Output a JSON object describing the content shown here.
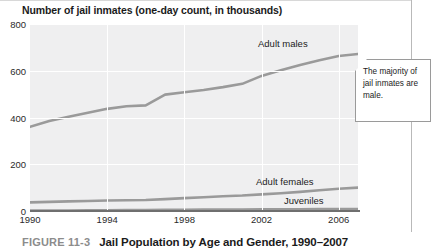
{
  "chart_title": "Number of jail inmates (one-day count, in thousands)",
  "caption": {
    "number": "FIGURE 11-3",
    "title": "Jail Population by Age and Gender, 1990–2007"
  },
  "callout": {
    "text": "The majority of jail inmates are male."
  },
  "colors": {
    "plot_background": "#efeff0",
    "gridline": "#ffffff",
    "series_line": "#9a9a9a",
    "axis": "#6f6f6f",
    "text": "#1b1b1b",
    "caption_number": "#8c8c8c"
  },
  "chart_data": {
    "type": "line",
    "title": "Number of jail inmates (one-day count, in thousands)",
    "xlabel": "",
    "ylabel": "Number of jail inmates (one-day count, in thousands)",
    "xlim": [
      1990,
      2007
    ],
    "ylim": [
      0,
      800
    ],
    "yticks": [
      0,
      200,
      400,
      600,
      800
    ],
    "ytick_labels": [
      "0",
      "200",
      "400",
      "600",
      "800"
    ],
    "xticks": [
      1990,
      1994,
      1998,
      2002,
      2006
    ],
    "xtick_labels": [
      "1990",
      "1994",
      "1998",
      "2002",
      "2006"
    ],
    "grid": true,
    "legend": "inline-labels",
    "x": [
      1990,
      1991,
      1992,
      1993,
      1994,
      1995,
      1996,
      1997,
      1998,
      1999,
      2000,
      2001,
      2002,
      2003,
      2004,
      2005,
      2006,
      2007
    ],
    "series": [
      {
        "name": "Adult males",
        "values": [
          360,
          385,
          403,
          420,
          437,
          448,
          452,
          498,
          508,
          518,
          530,
          544,
          578,
          602,
          625,
          645,
          663,
          672
        ]
      },
      {
        "name": "Adult females",
        "values": [
          37,
          39,
          41,
          43,
          45,
          46,
          47,
          51,
          55,
          59,
          63,
          66,
          71,
          76,
          82,
          89,
          95,
          100
        ]
      },
      {
        "name": "Juveniles",
        "values": [
          2,
          2,
          2,
          3,
          3,
          4,
          4,
          5,
          5,
          6,
          6,
          6,
          7,
          7,
          7,
          8,
          8,
          8
        ]
      }
    ],
    "annotations": [
      {
        "text": "The majority of jail inmates are male.",
        "anchor": "Adult males"
      }
    ]
  }
}
